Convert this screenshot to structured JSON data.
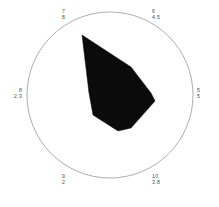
{
  "chart_data": {
    "type": "radar",
    "title": "",
    "subtitle": "",
    "xlabel": "",
    "ylabel": "",
    "grid": false,
    "legend": "none",
    "axis_max": 10,
    "outline": "circle",
    "categories": [
      "7",
      "6",
      "5",
      "10",
      "9",
      "8"
    ],
    "values": [
      8,
      4.5,
      5,
      3.8,
      2,
      2.3
    ],
    "points": [
      {
        "index": "7",
        "value": "8",
        "angle_deg": 120,
        "position": "top-left"
      },
      {
        "index": "6",
        "value": "4.5",
        "angle_deg": 60,
        "position": "top-right"
      },
      {
        "index": "5",
        "value": "5",
        "angle_deg": 0,
        "position": "right"
      },
      {
        "index": "10",
        "value": "3.8",
        "angle_deg": -60,
        "position": "bottom-right"
      },
      {
        "index": "9",
        "value": "2",
        "angle_deg": -120,
        "position": "bottom-left"
      },
      {
        "index": "8",
        "value": "2.3",
        "angle_deg": 180,
        "position": "left"
      }
    ]
  },
  "plot": {
    "circle": {
      "cx": 110,
      "cy": 95,
      "r": 83,
      "stroke_color": "#8a8a92",
      "stroke_width": 0.7,
      "fill": "none"
    },
    "polygon": {
      "fill_color": "#0b0b0b",
      "stroke_color": "#0b0b0b",
      "vertices": "82,35 131,67 151,93 155,101 131,128 118,131 93,115 89,93"
    },
    "background_color": "#ffffff",
    "label_color": "#4a4a52"
  },
  "labels": {
    "top_left": {
      "index": "7",
      "value": "8"
    },
    "top_right": {
      "index": "6",
      "value": "4.5"
    },
    "left": {
      "index": "8",
      "value": "2.3"
    },
    "right": {
      "index": "5",
      "value": "5"
    },
    "bottom_left": {
      "index": "9",
      "value": "2"
    },
    "bottom_right": {
      "index": "10",
      "value": "3.8"
    }
  }
}
